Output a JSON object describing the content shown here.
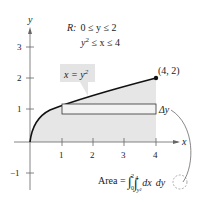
{
  "diagram": {
    "axes": {
      "x_label": "x",
      "y_label": "y",
      "x_ticks": [
        "1",
        "2",
        "3",
        "4"
      ],
      "y_ticks": [
        "3",
        "2",
        "1",
        "−1"
      ]
    },
    "region": {
      "label": "R:",
      "line1": "0 ≤ y ≤ 2",
      "line2_base": "y",
      "line2_sup": "2",
      "line2_rest": " ≤ x ≤ 4"
    },
    "curve_label": {
      "base": "x = y",
      "sup": "2"
    },
    "point_label": "(4, 2)",
    "delta_label": "Δy",
    "area_formula": {
      "prefix": "Area = ",
      "outer_lower": "0",
      "outer_upper": "2",
      "inner_lower": "y²",
      "inner_upper": "4",
      "integrand": "dx",
      "differential": "dy"
    },
    "colors": {
      "shade": "#e6e6e6",
      "curve": "#111111",
      "label_bg": "#e4e4e4"
    }
  }
}
